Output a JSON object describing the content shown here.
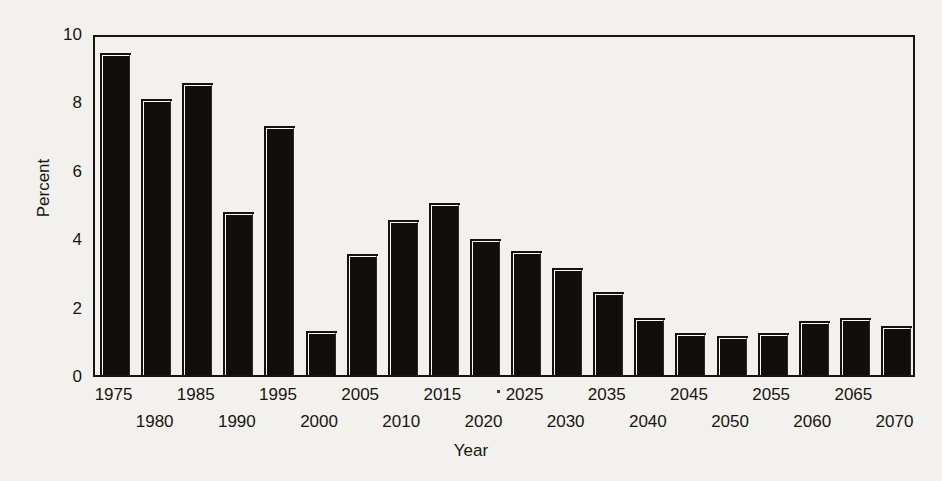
{
  "chart_data": {
    "type": "bar",
    "title": "",
    "xlabel": "Year",
    "ylabel": "Percent",
    "ylim": [
      0,
      10
    ],
    "yticks": [
      0,
      2,
      4,
      6,
      8,
      10
    ],
    "ytick_labels": [
      "0",
      "2",
      "4",
      "6",
      "8",
      "10"
    ],
    "grid": false,
    "legend": null,
    "categories": [
      "1975",
      "1980",
      "1985",
      "1990",
      "1995",
      "2000",
      "2005",
      "2010",
      "2015",
      "2020",
      "2025",
      "2030",
      "2035",
      "2040",
      "2045",
      "2050",
      "2055",
      "2060",
      "2065",
      "2070"
    ],
    "values": [
      9.4,
      8.05,
      8.5,
      4.75,
      7.25,
      1.25,
      3.5,
      4.5,
      5.0,
      3.95,
      3.6,
      3.1,
      2.4,
      1.65,
      1.2,
      1.1,
      1.2,
      1.55,
      1.65,
      1.4
    ],
    "series": [
      {
        "name": "Percent",
        "values": [
          9.4,
          8.05,
          8.5,
          4.75,
          7.25,
          1.25,
          3.5,
          4.5,
          5.0,
          3.95,
          3.6,
          3.1,
          2.4,
          1.65,
          1.2,
          1.1,
          1.2,
          1.55,
          1.65,
          1.4
        ]
      }
    ],
    "xtick_rows": [
      [
        "1975",
        "1985",
        "1995",
        "2005",
        "2015",
        "2025",
        "2035",
        "2045",
        "2055",
        "2065"
      ],
      [
        "1980",
        "1990",
        "2000",
        "2010",
        "2020",
        "2030",
        "2040",
        "2050",
        "2060",
        "2070"
      ]
    ],
    "bar_color": "#100f0c",
    "background_color": "#f2f1ed",
    "axis_color": "#16150f"
  }
}
